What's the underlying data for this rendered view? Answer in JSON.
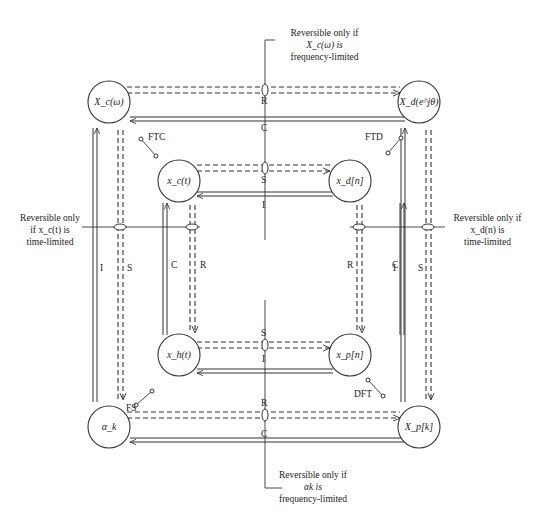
{
  "nodes": {
    "outer_top_left": "X_c(ω)",
    "outer_top_right": "X_d(e^jθ)",
    "outer_bottom_left": "α_k",
    "outer_bottom_right": "X_p[k]",
    "inner_top_left": "x_c(t)",
    "inner_top_right": "x_d[n]",
    "inner_bottom_left": "x_h(t)",
    "inner_bottom_right": "x_p[n]"
  },
  "edges": {
    "outer_top_dashed": "R",
    "outer_top_solid": "C",
    "outer_bottom_dashed": "R",
    "outer_bottom_solid": "C",
    "outer_left_solid": "I",
    "outer_left_dashed": "S",
    "outer_right_solid": "I",
    "outer_right_dashed": "S",
    "inner_top_dashed": "S",
    "inner_top_solid": "I",
    "inner_bottom_dashed": "S",
    "inner_bottom_solid": "I",
    "inner_left_solid": "C",
    "inner_left_dashed": "R",
    "inner_right_solid": "C",
    "inner_right_dashed": "R"
  },
  "transforms": {
    "top_left": "FTC",
    "top_right": "FTD",
    "bottom_left": "FS",
    "bottom_right": "DFT"
  },
  "notes": {
    "top": {
      "line1": "Reversible only if",
      "line2": "X_c(ω) is",
      "line3": "frequency-limited"
    },
    "left": {
      "line1": "Reversible only",
      "line2": "if x_c(t) is",
      "line3": "time-limited"
    },
    "right": {
      "line1": "Reversible only if",
      "line2": "x_d(n) is",
      "line3": "time-limited"
    },
    "bottom": {
      "line1": "Reversible only if",
      "line2": "αk is",
      "line3": "frequency-limited"
    }
  }
}
